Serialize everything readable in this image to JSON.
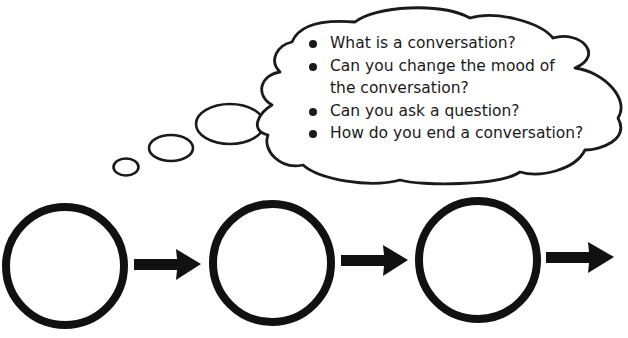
{
  "thought_cloud": {
    "questions": [
      {
        "line1": "What is a conversation?",
        "line2": ""
      },
      {
        "line1": "Can you change the mood of",
        "line2": "the conversation?"
      },
      {
        "line1": "Can you ask a question?",
        "line2": ""
      },
      {
        "line1": "How do you end a conversation?",
        "line2": ""
      }
    ]
  },
  "flow": {
    "steps": [
      {
        "label": ""
      },
      {
        "label": ""
      },
      {
        "label": ""
      }
    ],
    "stroke_color": "#111111"
  }
}
